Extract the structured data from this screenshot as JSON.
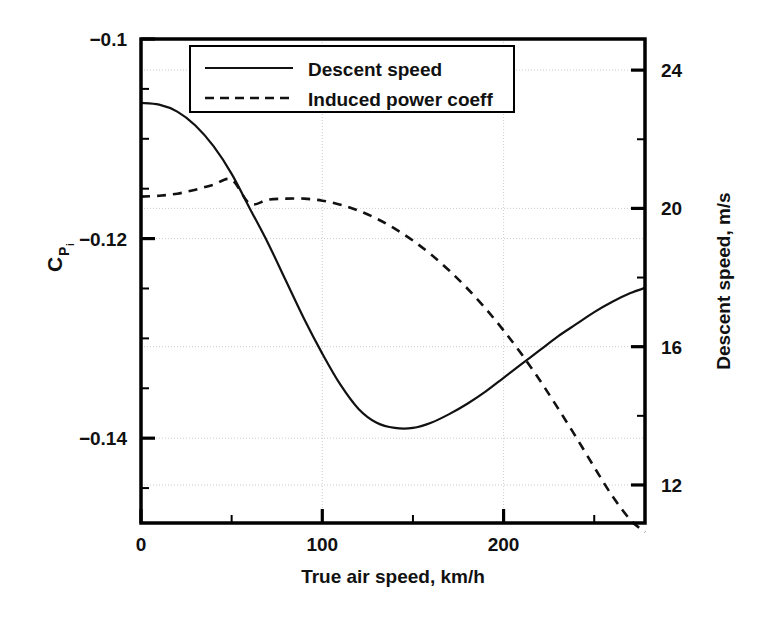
{
  "chart_data": {
    "type": "line",
    "title": "",
    "xlabel": "True air speed, km/h",
    "ylabel_left": "C_Pi",
    "ylabel_left_parts": {
      "base": "C",
      "sub": "P",
      "subsub": "i"
    },
    "ylabel_right": "Descent speed, m/s",
    "xlim": [
      0,
      278
    ],
    "ylim_left": [
      -0.1485,
      -0.1
    ],
    "ylim_right": [
      10.9,
      24.9
    ],
    "xticks_major": [
      0,
      100,
      200
    ],
    "xticks_major_labels": [
      "0",
      "100",
      "200"
    ],
    "xticks_minor": [
      50,
      150,
      250
    ],
    "yticks_left_major": [
      -0.1,
      -0.12,
      -0.14
    ],
    "yticks_left_major_labels": [
      "−0.1",
      "−0.12",
      "−0.14"
    ],
    "yticks_left_minor": [
      -0.105,
      -0.11,
      -0.115,
      -0.125,
      -0.13,
      -0.135,
      -0.145
    ],
    "yticks_right_major": [
      24,
      20,
      16,
      12
    ],
    "yticks_right_major_labels": [
      "24",
      "20",
      "16",
      "12"
    ],
    "yticks_right_minor": [
      22,
      18,
      14
    ],
    "grid": true,
    "legend_position": "top-center",
    "series": [
      {
        "name": "Descent speed",
        "style": "solid",
        "axis": "right",
        "units": "m/s",
        "x": [
          0,
          10,
          20,
          30,
          40,
          50,
          60,
          70,
          80,
          90,
          100,
          110,
          120,
          130,
          140,
          150,
          160,
          170,
          180,
          190,
          200,
          210,
          220,
          230,
          240,
          250,
          260,
          270,
          278
        ],
        "values": [
          23.05,
          23.0,
          22.8,
          22.4,
          21.8,
          21.0,
          20.0,
          19.0,
          17.9,
          16.8,
          15.8,
          14.9,
          14.2,
          13.8,
          13.65,
          13.65,
          13.8,
          14.05,
          14.35,
          14.7,
          15.1,
          15.5,
          15.9,
          16.3,
          16.65,
          17.0,
          17.3,
          17.55,
          17.7
        ]
      },
      {
        "name": "Induced power coeff",
        "style": "dashed",
        "axis": "left",
        "units": "",
        "x": [
          0,
          10,
          20,
          30,
          40,
          50,
          60,
          70,
          80,
          90,
          100,
          110,
          120,
          130,
          140,
          150,
          160,
          170,
          180,
          190,
          200,
          210,
          220,
          230,
          240,
          250,
          260,
          270,
          278
        ],
        "values": [
          -0.1158,
          -0.1157,
          -0.1155,
          -0.1151,
          -0.1146,
          -0.1141,
          -0.1165,
          -0.1161,
          -0.116,
          -0.116,
          -0.1162,
          -0.1166,
          -0.1172,
          -0.118,
          -0.119,
          -0.1202,
          -0.1216,
          -0.1232,
          -0.125,
          -0.127,
          -0.1292,
          -0.1316,
          -0.1342,
          -0.137,
          -0.1399,
          -0.1429,
          -0.1458,
          -0.1482,
          -0.1494
        ]
      }
    ],
    "legend": [
      {
        "label": "Descent speed",
        "style": "solid"
      },
      {
        "label": "Induced power coeff",
        "style": "dashed"
      }
    ],
    "colors": {
      "line": "#111111",
      "axis": "#000000",
      "grid": "#cccccc",
      "background": "#ffffff"
    }
  }
}
